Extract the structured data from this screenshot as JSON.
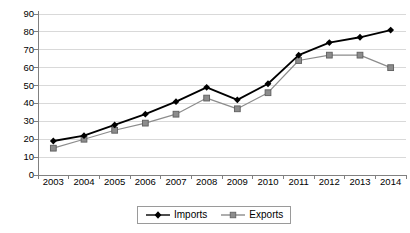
{
  "chart_data": {
    "type": "line",
    "title": "",
    "xlabel": "",
    "ylabel": "",
    "categories": [
      "2003",
      "2004",
      "2005",
      "2006",
      "2007",
      "2008",
      "2009",
      "2010",
      "2011",
      "2012",
      "2013",
      "2014"
    ],
    "series": [
      {
        "name": "Imports",
        "color": "#000000",
        "marker": "diamond",
        "values": [
          19,
          22,
          28,
          34,
          41,
          49,
          42,
          51,
          67,
          74,
          77,
          81
        ]
      },
      {
        "name": "Exports",
        "color": "#8c8c8c",
        "marker": "square",
        "values": [
          15,
          20,
          25,
          29,
          34,
          43,
          37,
          46,
          64,
          67,
          67,
          60
        ]
      }
    ],
    "ylim": [
      0,
      90
    ],
    "yticks": [
      0,
      10,
      20,
      30,
      40,
      50,
      60,
      70,
      80,
      90
    ],
    "ytick_labels": [
      "0",
      "10",
      "20",
      "30",
      "40",
      "50",
      "60",
      "70",
      "80",
      "90"
    ],
    "grid": true,
    "grid_axis": "y",
    "legend_position": "bottom-center",
    "legend_entries": [
      "Imports",
      "Exports"
    ]
  },
  "colors": {
    "imports": "#000000",
    "exports": "#8c8c8c",
    "gridline": "#d9d9d9",
    "axis": "#808080",
    "background": "#ffffff",
    "legend_border": "#9a9a9a"
  }
}
